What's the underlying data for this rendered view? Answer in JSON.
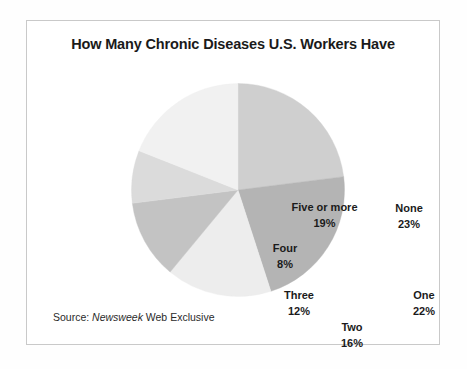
{
  "figure": {
    "title": "How Many Chronic Diseases U.S. Workers Have",
    "source_prefix": "Source:",
    "source_publication": "Newsweek",
    "source_suffix": "Web Exclusive",
    "frame_color": "#c9c9c9",
    "background_color": "#ffffff",
    "title_color": "#1a1a1a"
  },
  "chart_data": {
    "type": "pie",
    "title": "How Many Chronic Diseases U.S. Workers Have",
    "xlabel": "",
    "ylabel": "",
    "legend_position": "none",
    "labels_inside_slices": true,
    "start_angle_deg": 0,
    "direction": "clockwise",
    "categories": [
      "None",
      "One",
      "Two",
      "Three",
      "Four",
      "Five or more"
    ],
    "values": [
      23,
      22,
      16,
      12,
      8,
      19
    ],
    "value_suffix": "%",
    "colors": [
      "#cfcfcf",
      "#b4b4b4",
      "#ededed",
      "#c3c3c3",
      "#dbdbdb",
      "#f1f1f1"
    ],
    "slices": [
      {
        "label": "None",
        "value": 23,
        "value_text": "23%",
        "color": "#cfcfcf"
      },
      {
        "label": "One",
        "value": 22,
        "value_text": "22%",
        "color": "#b4b4b4"
      },
      {
        "label": "Two",
        "value": 16,
        "value_text": "16%",
        "color": "#ededed"
      },
      {
        "label": "Three",
        "value": 12,
        "value_text": "12%",
        "color": "#c3c3c3"
      },
      {
        "label": "Four",
        "value": 8,
        "value_text": "8%",
        "color": "#dbdbdb"
      },
      {
        "label": "Five or more",
        "value": 19,
        "value_text": "19%",
        "color": "#f1f1f1"
      }
    ]
  }
}
